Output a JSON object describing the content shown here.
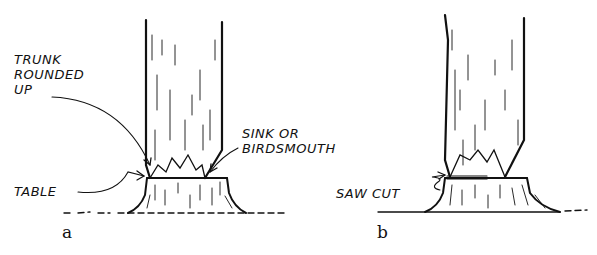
{
  "figure_a": {
    "caption": "a",
    "labels": {
      "trunk_rounded_up": [
        "TRUNK",
        "ROUNDED",
        "UP"
      ],
      "sink_or_birdsmouth": [
        "SINK OR",
        "BIRDSMOUTH"
      ],
      "table": "TABLE"
    }
  },
  "figure_b": {
    "caption": "b",
    "labels": {
      "saw_cut": "SAW CUT"
    }
  },
  "colors": {
    "ink": "#111111",
    "background": "#ffffff"
  }
}
